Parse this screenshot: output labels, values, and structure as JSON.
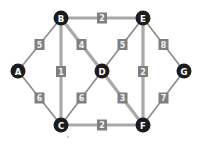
{
  "graph": {
    "nodes": [
      {
        "id": "A",
        "label": "A",
        "x": 18,
        "y": 71
      },
      {
        "id": "B",
        "label": "B",
        "x": 61,
        "y": 18
      },
      {
        "id": "C",
        "label": "C",
        "x": 61,
        "y": 125
      },
      {
        "id": "D",
        "label": "D",
        "x": 102,
        "y": 71
      },
      {
        "id": "E",
        "label": "E",
        "x": 143,
        "y": 18
      },
      {
        "id": "F",
        "label": "F",
        "x": 143,
        "y": 125
      },
      {
        "id": "G",
        "label": "G",
        "x": 184,
        "y": 71
      }
    ],
    "edges": [
      {
        "from": "A",
        "to": "B",
        "weight": "5",
        "highlighted": false
      },
      {
        "from": "A",
        "to": "C",
        "weight": "6",
        "highlighted": false
      },
      {
        "from": "B",
        "to": "C",
        "weight": "1",
        "highlighted": true
      },
      {
        "from": "B",
        "to": "D",
        "weight": "4",
        "highlighted": true
      },
      {
        "from": "B",
        "to": "E",
        "weight": "2",
        "highlighted": true
      },
      {
        "from": "C",
        "to": "D",
        "weight": "6",
        "highlighted": false
      },
      {
        "from": "C",
        "to": "F",
        "weight": "2",
        "highlighted": true
      },
      {
        "from": "D",
        "to": "E",
        "weight": "5",
        "highlighted": false
      },
      {
        "from": "D",
        "to": "F",
        "weight": "3",
        "highlighted": true
      },
      {
        "from": "E",
        "to": "F",
        "weight": "2",
        "highlighted": true
      },
      {
        "from": "E",
        "to": "G",
        "weight": "8",
        "highlighted": false
      },
      {
        "from": "F",
        "to": "G",
        "weight": "7",
        "highlighted": false
      }
    ],
    "colors": {
      "node_fill": "#1c1c1c",
      "node_text": "#ffffff",
      "edge": "#8a8a8a",
      "edge_highlight": "#a9a9a9",
      "label_fill": "#7f7f7f",
      "label_text": "#f2f2f2"
    }
  }
}
